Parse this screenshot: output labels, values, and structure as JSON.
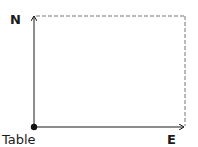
{
  "labels": {
    "north": "N",
    "east": "E",
    "origin": "Table"
  },
  "colors": {
    "line": "#1a1a1a",
    "dashed": "#777777"
  }
}
